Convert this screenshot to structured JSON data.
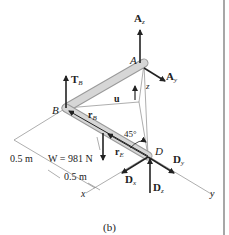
{
  "figure": {
    "caption": "(b)",
    "points": {
      "A": "A",
      "B": "B",
      "D": "D"
    },
    "forces": {
      "Az": {
        "main": "A",
        "sub": "z"
      },
      "Ay": {
        "main": "A",
        "sub": "y"
      },
      "TB": {
        "main": "T",
        "sub": "B"
      },
      "Dx": {
        "main": "D",
        "sub": "x"
      },
      "Dy": {
        "main": "D",
        "sub": "y"
      },
      "Dz": {
        "main": "D",
        "sub": "z"
      }
    },
    "vectors": {
      "rB": {
        "main": "r",
        "sub": "B"
      },
      "rE": {
        "main": "r",
        "sub": "E"
      },
      "u": "u"
    },
    "weight_label": "W = 981 N",
    "dim_1": "0.5 m",
    "dim_2": "0.5 m",
    "angle_label": "45°",
    "axes": {
      "x": "x",
      "y": "y",
      "z": "z"
    },
    "colors": {
      "rod": "#cfcfcf",
      "rod_edge": "#9a9a9a",
      "arrow": "#222222",
      "thin": "#777777",
      "frame": "#8a8a8a"
    }
  }
}
